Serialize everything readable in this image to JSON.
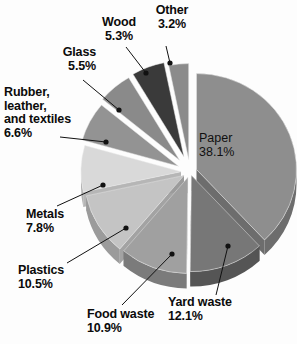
{
  "chart_data": {
    "type": "pie",
    "title": "",
    "subtitle": "",
    "xlabel": "",
    "ylabel": "",
    "legend_position": "callout-labels",
    "grid": false,
    "units": "percent",
    "exploded": true,
    "three_d": true,
    "total": 100.0,
    "categories": [
      "Paper",
      "Yard waste",
      "Food waste",
      "Plastics",
      "Metals",
      "Rubber, leather, and textiles",
      "Glass",
      "Wood",
      "Other"
    ],
    "values": [
      38.1,
      12.1,
      10.9,
      10.5,
      7.8,
      6.6,
      5.5,
      5.3,
      3.2
    ],
    "slices": [
      {
        "label": "Paper",
        "value": 38.1,
        "value_text": "38.1%",
        "color": "#8e8e8e",
        "side_color": "#6d6d6d",
        "label_placement": "inside"
      },
      {
        "label": "Yard waste",
        "value": 12.1,
        "value_text": "12.1%",
        "color": "#777777",
        "side_color": "#555555",
        "label_placement": "callout"
      },
      {
        "label": "Food waste",
        "value": 10.9,
        "value_text": "10.9%",
        "color": "#a0a0a0",
        "side_color": "#7b7b7b",
        "label_placement": "callout"
      },
      {
        "label": "Plastics",
        "value": 10.5,
        "value_text": "10.5%",
        "color": "#c4c4c4",
        "side_color": "#9b9b9b",
        "label_placement": "callout"
      },
      {
        "label": "Metals",
        "value": 7.8,
        "value_text": "7.8%",
        "color": "#d9d9d9",
        "side_color": "#b0b0b0",
        "label_placement": "callout"
      },
      {
        "label": "Rubber, leather, and textiles",
        "value": 6.6,
        "value_text": "6.6%",
        "color": "#939393",
        "side_color": "#6f6f6f",
        "label_placement": "callout"
      },
      {
        "label": "Glass",
        "value": 5.5,
        "value_text": "5.5%",
        "color": "#8a8a8a",
        "side_color": "#666666",
        "label_placement": "callout"
      },
      {
        "label": "Wood",
        "value": 5.3,
        "value_text": "5.3%",
        "color": "#3a3a3a",
        "side_color": "#262626",
        "label_placement": "callout"
      },
      {
        "label": "Other",
        "value": 3.2,
        "value_text": "3.2%",
        "color": "#8b8b8b",
        "side_color": "#676767",
        "label_placement": "callout"
      }
    ]
  },
  "labels": {
    "paper": "Paper\n38.1%",
    "yard_waste": "Yard waste\n12.1%",
    "food_waste": "Food waste\n10.9%",
    "plastics": "Plastics\n10.5%",
    "metals": "Metals\n7.8%",
    "rubber": "Rubber,\nleather,\nand textiles\n6.6%",
    "glass": "Glass\n5.5%",
    "wood": "Wood\n5.3%",
    "other": "Other\n3.2%"
  },
  "style": {
    "background": "#fdfdfd",
    "leader_line_color": "#111111",
    "text_color": "#0b0b0b"
  }
}
